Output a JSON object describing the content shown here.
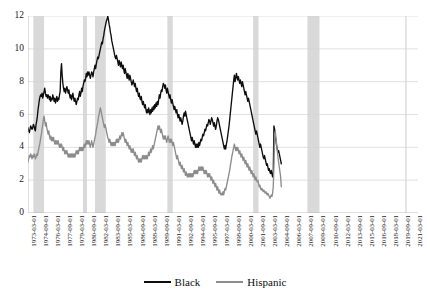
{
  "chart_data": {
    "type": "line",
    "title": "",
    "subtitle": "",
    "xlabel": "",
    "ylabel": "",
    "ylim": [
      0,
      12
    ],
    "yticks": [
      0,
      2,
      4,
      6,
      8,
      10,
      12
    ],
    "grid": "horizontal",
    "legend_position": "bottom",
    "colors": {
      "Black": "#0d0d0d",
      "Hispanic": "#8c8c8c",
      "recession_band": "#d9d9d9",
      "gridline": "#d4d4d4"
    },
    "xtick_labels": [
      "1973-03-01",
      "1974-09-01",
      "1976-03-01",
      "1977-09-01",
      "1979-03-01",
      "1980-09-01",
      "1982-03-01",
      "1983-09-01",
      "1985-03-01",
      "1986-09-01",
      "1988-03-01",
      "1989-09-01",
      "1991-03-01",
      "1992-09-01",
      "1994-03-01",
      "1995-09-01",
      "1997-03-01",
      "1998-09-01",
      "2000-03-01",
      "2001-09-01",
      "2003-03-01",
      "2004-09-01",
      "2006-03-01",
      "2007-09-01",
      "2009-03-01",
      "2010-09-01",
      "2012-03-01",
      "2013-09-01",
      "2015-03-01",
      "2016-09-01",
      "2018-03-01",
      "2019-09-01",
      "2021-03-01"
    ],
    "x_start": "1973-03-01",
    "x_end": "2021-09-01",
    "x_frequency": "monthly",
    "xtick_interval_months": 18,
    "recession_bands": [
      {
        "start": "1973-11-01",
        "end": "1975-03-01"
      },
      {
        "start": "1980-01-01",
        "end": "1980-07-01"
      },
      {
        "start": "1981-07-01",
        "end": "1982-11-01"
      },
      {
        "start": "1990-07-01",
        "end": "1991-03-01"
      },
      {
        "start": "2001-03-01",
        "end": "2001-11-01"
      },
      {
        "start": "2007-12-01",
        "end": "2009-06-01"
      },
      {
        "start": "2020-02-01",
        "end": "2020-04-01"
      }
    ],
    "series": [
      {
        "name": "Black",
        "color": "#0d0d0d",
        "values": [
          5.2,
          5.0,
          4.9,
          5.1,
          5.3,
          5.2,
          5.1,
          5.2,
          5.4,
          5.3,
          5.1,
          5.0,
          5.4,
          5.6,
          5.9,
          6.3,
          6.6,
          6.9,
          7.1,
          7.2,
          7.1,
          7.3,
          7.0,
          7.2,
          7.4,
          7.6,
          7.3,
          7.1,
          7.2,
          7.0,
          7.2,
          7.1,
          6.9,
          7.1,
          6.8,
          7.0,
          6.9,
          7.2,
          7.0,
          6.8,
          7.0,
          6.7,
          6.9,
          7.1,
          6.8,
          7.0,
          6.9,
          7.2,
          7.4,
          8.6,
          9.1,
          8.4,
          7.9,
          7.6,
          7.4,
          7.6,
          7.3,
          7.5,
          7.7,
          7.5,
          7.3,
          7.5,
          7.2,
          7.0,
          7.2,
          6.9,
          7.1,
          7.3,
          7.0,
          6.8,
          7.0,
          6.8,
          6.6,
          6.8,
          7.0,
          6.9,
          7.2,
          7.4,
          7.1,
          7.3,
          7.6,
          7.4,
          7.7,
          7.9,
          8.1,
          8.0,
          8.2,
          8.5,
          8.3,
          8.6,
          8.4,
          8.6,
          8.4,
          8.2,
          8.4,
          8.6,
          8.5,
          8.3,
          8.6,
          8.8,
          9.0,
          8.8,
          9.1,
          9.3,
          9.5,
          9.4,
          9.6,
          9.8,
          10.0,
          10.2,
          10.4,
          10.3,
          10.6,
          10.8,
          11.1,
          11.3,
          11.5,
          11.7,
          11.8,
          12.0,
          11.8,
          11.5,
          11.3,
          11.0,
          10.8,
          10.5,
          10.3,
          10.1,
          9.9,
          9.7,
          9.5,
          9.4,
          9.6,
          9.4,
          9.2,
          9.0,
          9.3,
          9.1,
          8.9,
          9.2,
          9.0,
          8.8,
          9.0,
          8.7,
          8.5,
          8.8,
          8.6,
          8.4,
          8.2,
          8.5,
          8.3,
          8.1,
          8.4,
          8.2,
          8.0,
          7.8,
          7.9,
          8.1,
          7.9,
          7.7,
          7.9,
          7.6,
          7.4,
          7.6,
          7.3,
          7.1,
          7.3,
          7.0,
          6.9,
          7.1,
          6.8,
          6.6,
          6.8,
          6.6,
          6.4,
          6.6,
          6.3,
          6.1,
          6.3,
          6.1,
          6.4,
          6.2,
          6.0,
          6.3,
          6.1,
          6.4,
          6.2,
          6.5,
          6.3,
          6.6,
          6.4,
          6.7,
          6.5,
          6.8,
          6.6,
          6.9,
          7.2,
          7.0,
          7.3,
          7.5,
          7.4,
          7.7,
          7.9,
          7.8,
          7.6,
          7.8,
          7.5,
          7.3,
          7.6,
          7.4,
          7.2,
          7.0,
          7.2,
          6.9,
          6.7,
          6.9,
          6.7,
          6.5,
          6.3,
          6.5,
          6.3,
          6.1,
          6.3,
          6.0,
          5.8,
          6.0,
          5.8,
          5.6,
          5.8,
          5.6,
          5.4,
          5.6,
          5.9,
          6.1,
          5.9,
          6.2,
          6.0,
          5.8,
          5.6,
          5.4,
          5.2,
          5.0,
          4.8,
          4.6,
          4.4,
          4.6,
          4.4,
          4.2,
          4.4,
          4.2,
          4.0,
          4.2,
          4.0,
          4.2,
          4.0,
          4.3,
          4.1,
          4.3,
          4.5,
          4.4,
          4.6,
          4.8,
          4.7,
          4.9,
          5.1,
          5.0,
          5.2,
          5.4,
          5.3,
          5.5,
          5.7,
          5.6,
          5.4,
          5.6,
          5.8,
          5.7,
          5.5,
          5.3,
          5.5,
          5.3,
          5.1,
          5.3,
          5.6,
          5.8,
          5.7,
          5.5,
          5.3,
          5.1,
          4.9,
          4.7,
          4.5,
          4.3,
          4.1,
          3.9,
          4.1,
          3.9,
          4.2,
          4.4,
          4.7,
          5.0,
          5.3,
          5.7,
          6.1,
          6.5,
          6.9,
          7.3,
          7.7,
          8.1,
          8.4,
          8.0,
          8.2,
          8.5,
          8.3,
          8.1,
          8.3,
          8.1,
          7.9,
          8.1,
          7.9,
          7.7,
          8.0,
          7.8,
          7.6,
          7.4,
          7.2,
          7.4,
          7.2,
          7.0,
          6.8,
          7.0,
          6.8,
          6.6,
          6.4,
          6.2,
          6.0,
          5.8,
          5.6,
          5.4,
          5.2,
          5.0,
          4.8,
          5.0,
          4.8,
          4.6,
          4.4,
          4.2,
          4.0,
          4.2,
          4.0,
          3.8,
          3.6,
          3.4,
          3.3,
          3.5,
          3.3,
          3.1,
          2.9,
          3.0,
          2.8,
          2.6,
          2.7,
          2.5,
          2.4,
          2.6,
          2.4,
          2.2,
          2.4,
          5.3,
          5.1,
          4.7,
          4.4,
          4.1,
          3.9,
          3.7,
          3.8,
          3.6,
          3.4,
          3.2,
          3.0
        ]
      },
      {
        "name": "Hispanic",
        "color": "#8c8c8c",
        "values": [
          3.1,
          3.3,
          3.5,
          3.4,
          3.6,
          3.5,
          3.3,
          3.5,
          3.4,
          3.6,
          3.5,
          3.3,
          3.4,
          3.6,
          3.5,
          3.7,
          3.9,
          4.1,
          4.3,
          4.6,
          4.8,
          5.1,
          5.4,
          5.7,
          5.9,
          5.6,
          5.3,
          5.5,
          5.2,
          5.0,
          4.8,
          5.0,
          4.7,
          4.5,
          4.7,
          4.4,
          4.6,
          4.4,
          4.6,
          4.4,
          4.2,
          4.4,
          4.2,
          4.4,
          4.2,
          4.4,
          4.2,
          4.0,
          4.2,
          4.0,
          4.2,
          4.0,
          3.8,
          4.0,
          3.8,
          3.6,
          3.8,
          3.6,
          3.8,
          3.6,
          3.4,
          3.6,
          3.4,
          3.6,
          3.4,
          3.6,
          3.4,
          3.6,
          3.4,
          3.6,
          3.4,
          3.6,
          3.8,
          3.6,
          3.8,
          3.6,
          3.8,
          4.0,
          3.8,
          4.0,
          3.8,
          4.0,
          3.8,
          4.0,
          4.2,
          4.0,
          4.2,
          4.4,
          4.2,
          4.4,
          4.2,
          4.4,
          4.2,
          4.0,
          4.2,
          4.4,
          4.2,
          4.0,
          4.2,
          4.4,
          4.6,
          4.8,
          5.1,
          5.3,
          5.5,
          5.8,
          6.0,
          6.2,
          6.4,
          6.2,
          6.0,
          5.8,
          5.6,
          5.4,
          5.2,
          5.4,
          5.2,
          5.0,
          4.8,
          4.6,
          4.5,
          4.3,
          4.5,
          4.3,
          4.1,
          4.3,
          4.1,
          4.3,
          4.1,
          4.3,
          4.1,
          4.3,
          4.5,
          4.3,
          4.5,
          4.3,
          4.5,
          4.7,
          4.5,
          4.7,
          4.9,
          4.7,
          4.9,
          4.7,
          4.5,
          4.3,
          4.5,
          4.3,
          4.1,
          4.3,
          4.1,
          3.9,
          4.1,
          3.9,
          3.7,
          3.9,
          3.7,
          3.9,
          3.7,
          3.5,
          3.7,
          3.5,
          3.3,
          3.5,
          3.3,
          3.1,
          3.3,
          3.1,
          3.3,
          3.1,
          3.3,
          3.5,
          3.3,
          3.5,
          3.3,
          3.5,
          3.3,
          3.5,
          3.3,
          3.5,
          3.7,
          3.5,
          3.7,
          3.9,
          3.7,
          3.9,
          4.1,
          3.9,
          4.1,
          4.3,
          4.5,
          4.7,
          4.9,
          5.1,
          5.3,
          5.1,
          5.3,
          5.1,
          4.9,
          5.1,
          4.9,
          4.7,
          4.5,
          4.7,
          4.5,
          4.7,
          4.5,
          4.3,
          4.5,
          4.7,
          4.5,
          4.3,
          4.5,
          4.3,
          4.5,
          4.3,
          4.1,
          4.3,
          4.1,
          3.9,
          3.7,
          3.5,
          3.3,
          3.5,
          3.3,
          3.1,
          2.9,
          3.1,
          2.9,
          2.7,
          2.9,
          2.7,
          2.5,
          2.7,
          2.5,
          2.3,
          2.5,
          2.3,
          2.2,
          2.4,
          2.2,
          2.4,
          2.2,
          2.4,
          2.2,
          2.4,
          2.2,
          2.4,
          2.6,
          2.4,
          2.6,
          2.4,
          2.6,
          2.4,
          2.6,
          2.8,
          2.6,
          2.8,
          2.6,
          2.8,
          2.6,
          2.8,
          2.6,
          2.4,
          2.6,
          2.4,
          2.6,
          2.4,
          2.2,
          2.4,
          2.2,
          2.4,
          2.2,
          2.0,
          2.2,
          2.0,
          1.8,
          2.0,
          1.8,
          1.6,
          1.8,
          1.6,
          1.4,
          1.6,
          1.4,
          1.2,
          1.4,
          1.2,
          1.1,
          1.2,
          1.1,
          1.3,
          1.1,
          1.3,
          1.5,
          1.4,
          1.6,
          1.8,
          2.0,
          2.2,
          2.4,
          2.6,
          2.9,
          3.1,
          3.4,
          3.6,
          3.8,
          4.0,
          4.2,
          4.0,
          3.8,
          4.0,
          3.8,
          4.0,
          3.8,
          3.6,
          3.8,
          3.6,
          3.4,
          3.6,
          3.4,
          3.2,
          3.4,
          3.2,
          3.0,
          3.2,
          3.0,
          2.8,
          3.0,
          2.8,
          2.6,
          2.8,
          2.6,
          2.4,
          2.6,
          2.4,
          2.2,
          2.4,
          2.2,
          2.0,
          2.2,
          2.0,
          1.9,
          2.0,
          1.8,
          1.6,
          1.7,
          1.5,
          1.4,
          1.5,
          1.4,
          1.3,
          1.4,
          1.3,
          1.2,
          1.3,
          1.2,
          1.1,
          1.2,
          1.1,
          1.0,
          0.9,
          1.0,
          1.1,
          1.0,
          1.2,
          1.6,
          2.9,
          4.8,
          5.0,
          4.6,
          4.2,
          3.8,
          3.4,
          3.1,
          2.8,
          2.5,
          2.2,
          1.6
        ]
      }
    ]
  },
  "legend": {
    "items": [
      {
        "label": "Black",
        "color": "#0d0d0d"
      },
      {
        "label": "Hispanic",
        "color": "#8c8c8c"
      }
    ]
  }
}
